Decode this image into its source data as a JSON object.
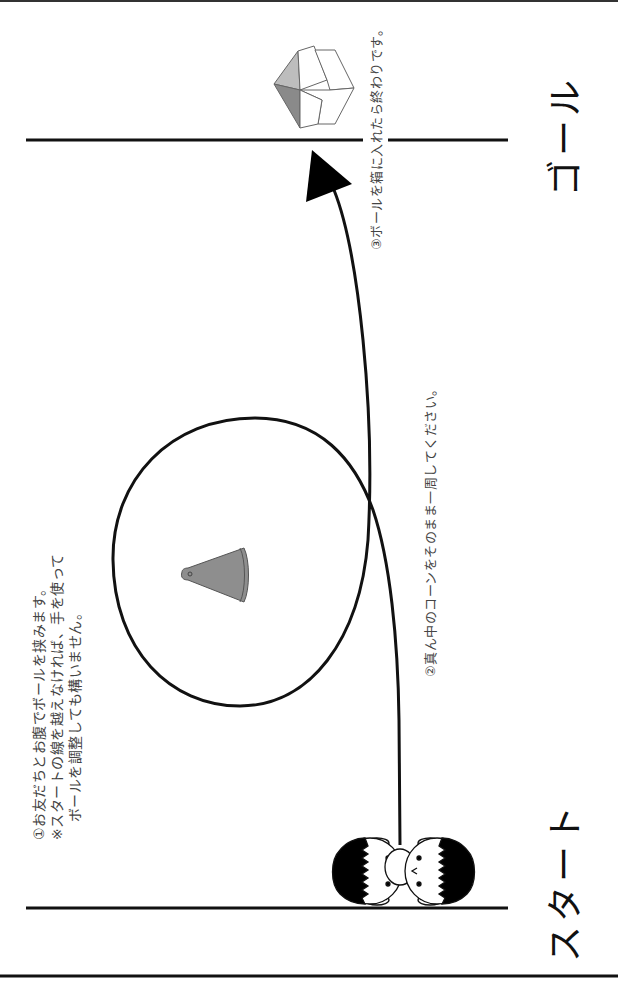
{
  "diagram": {
    "goal_label": "ゴール",
    "start_label": "スタート",
    "steps": {
      "step1_line1": "①お友だちとお腹でボールを挟みます。",
      "step1_line2": "※スタートの線を越えなければ、手を使って",
      "step1_line3": "ボールを調整しても構いません。",
      "step2": "②真ん中のコーンをそのまま一周してください。",
      "step3": "③ボールを箱に入れたら終わりです。"
    },
    "elements": {
      "cone_icon": "traffic-cone",
      "box_icon": "open-box",
      "children_icon": "two-children-holding-ball",
      "path": "loop-around-cone-to-goal",
      "arrow": "direction-arrow"
    },
    "colors": {
      "line": "#111111",
      "cone": "#8e8e8e",
      "box_light": "#bdbdbd",
      "box_dark": "#8a8a8a",
      "text": "#444444"
    }
  }
}
